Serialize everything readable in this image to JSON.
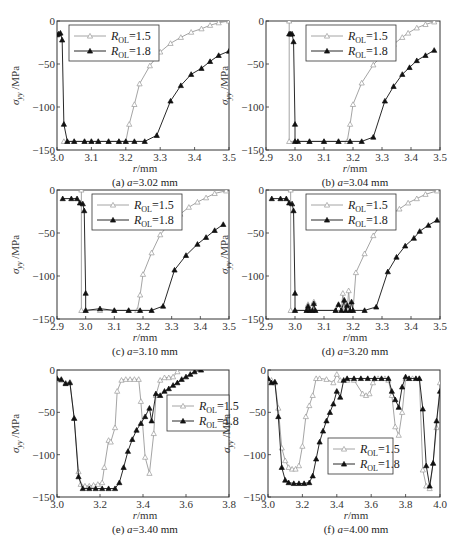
{
  "figure": {
    "y_label": "σyy /MPa",
    "x_label": "r/mm",
    "legend": [
      {
        "name": "ROL=1.5",
        "label_main": "R",
        "label_sub": "OL",
        "label_val": "=1.5",
        "marker": "open-triangle",
        "color": "#9a9a9a"
      },
      {
        "name": "ROL=1.8",
        "label_main": "R",
        "label_sub": "OL",
        "label_val": "=1.8",
        "marker": "filled-triangle",
        "color": "#111111"
      }
    ]
  },
  "chart_data": [
    {
      "id": "a",
      "type": "line",
      "caption_prefix": "(a) ",
      "caption_var": "a",
      "caption_value": "=3.02 mm",
      "xlabel": "r/mm",
      "ylabel": "σyy /MPa",
      "xlim": [
        3.0,
        3.5
      ],
      "ylim": [
        -150,
        0
      ],
      "xticks": [
        "3.0",
        "3.1",
        "3.2",
        "3.3",
        "3.4",
        "3.5"
      ],
      "yticks": [
        "0",
        "-50",
        "-100",
        "-150"
      ],
      "legend_position": "upper-left",
      "box": [
        57,
        21,
        229,
        150
      ],
      "series": [
        {
          "name": "ROL=1.5",
          "x": [
            3.02,
            3.03,
            3.05,
            3.08,
            3.1,
            3.12,
            3.15,
            3.18,
            3.2,
            3.21,
            3.225,
            3.24,
            3.27,
            3.3,
            3.33,
            3.36,
            3.39,
            3.42,
            3.445,
            3.47,
            3.5
          ],
          "y": [
            -140,
            -140,
            -140,
            -140,
            -140,
            -140,
            -140,
            -140,
            -140,
            -120,
            -97,
            -73,
            -52,
            -36,
            -26,
            -19,
            -13,
            -9,
            -5,
            -2,
            0
          ]
        },
        {
          "name": "ROL=1.8",
          "x": [
            3.0,
            3.005,
            3.01,
            3.015,
            3.02,
            3.03,
            3.05,
            3.08,
            3.1,
            3.12,
            3.15,
            3.18,
            3.2,
            3.225,
            3.255,
            3.29,
            3.33,
            3.36,
            3.39,
            3.42,
            3.445,
            3.47,
            3.5
          ],
          "y": [
            -16,
            -15,
            -14,
            -22,
            -120,
            -140,
            -140,
            -140,
            -140,
            -140,
            -140,
            -140,
            -140,
            -140,
            -140,
            -133,
            -93,
            -75,
            -62,
            -55,
            -47,
            -40,
            -35
          ]
        }
      ]
    },
    {
      "id": "b",
      "type": "line",
      "caption_prefix": "(b) ",
      "caption_var": "a",
      "caption_value": "=3.04 mm",
      "xlabel": "r/mm",
      "ylabel": "σyy /MPa",
      "xlim": [
        2.9,
        3.5
      ],
      "ylim": [
        -150,
        0
      ],
      "xticks": [
        "2.9",
        "3.0",
        "3.1",
        "3.2",
        "3.3",
        "3.4",
        "3.5"
      ],
      "yticks": [
        "0",
        "-50",
        "-100",
        "-150"
      ],
      "legend_position": "upper-center",
      "box": [
        266,
        21,
        440,
        150
      ],
      "series": [
        {
          "name": "ROL=1.5",
          "x": [
            2.98,
            2.98,
            3.0,
            3.05,
            3.1,
            3.15,
            3.18,
            3.19,
            3.2,
            3.23,
            3.27,
            3.31,
            3.34,
            3.37,
            3.39,
            3.42,
            3.45,
            3.48
          ],
          "y": [
            0,
            -140,
            -140,
            -140,
            -140,
            -140,
            -140,
            -120,
            -97,
            -72,
            -51,
            -36,
            -27,
            -19,
            -14,
            -8,
            -4,
            -1
          ]
        },
        {
          "name": "ROL=1.8",
          "x": [
            2.98,
            2.985,
            2.99,
            2.995,
            3.0,
            3.0,
            3.01,
            3.05,
            3.1,
            3.15,
            3.19,
            3.23,
            3.27,
            3.31,
            3.34,
            3.37,
            3.395,
            3.42,
            3.45,
            3.48
          ],
          "y": [
            -15,
            -15,
            -15,
            -24,
            -120,
            -140,
            -140,
            -140,
            -140,
            -140,
            -140,
            -140,
            -135,
            -93,
            -76,
            -62,
            -54,
            -46,
            -40,
            -34
          ]
        }
      ]
    },
    {
      "id": "c",
      "type": "line",
      "caption_prefix": "(c) ",
      "caption_var": "a",
      "caption_value": "=3.10 mm",
      "xlabel": "r/mm",
      "ylabel": "σyy /MPa",
      "xlim": [
        2.9,
        3.5
      ],
      "ylim": [
        -150,
        0
      ],
      "xticks": [
        "2.9",
        "3.0",
        "3.1",
        "3.2",
        "3.3",
        "3.4",
        "3.5"
      ],
      "yticks": [
        "0",
        "-50",
        "-100",
        "-150"
      ],
      "legend_position": "upper-center",
      "box": [
        57,
        190,
        229,
        319
      ],
      "series": [
        {
          "name": "ROL=1.5",
          "x": [
            2.985,
            2.985,
            3.0,
            3.05,
            3.1,
            3.15,
            3.18,
            3.19,
            3.2,
            3.23,
            3.26,
            3.3,
            3.33,
            3.36,
            3.39,
            3.42,
            3.45,
            3.49
          ],
          "y": [
            0,
            -140,
            -140,
            -140,
            -140,
            -140,
            -140,
            -122,
            -98,
            -73,
            -52,
            -36,
            -28,
            -20,
            -14,
            -9,
            -4,
            -1
          ]
        },
        {
          "name": "ROL=1.8",
          "x": [
            2.92,
            2.95,
            2.97,
            2.98,
            2.99,
            2.995,
            3.0,
            3.0,
            3.05,
            3.1,
            3.15,
            3.19,
            3.23,
            3.27,
            3.31,
            3.35,
            3.39,
            3.42,
            3.45,
            3.48
          ],
          "y": [
            -10,
            -10,
            -10,
            -15,
            -16,
            -24,
            -120,
            -140,
            -138,
            -140,
            -140,
            -140,
            -140,
            -135,
            -93,
            -76,
            -63,
            -55,
            -47,
            -40
          ]
        }
      ]
    },
    {
      "id": "d",
      "type": "line",
      "caption_prefix": "(d) ",
      "caption_var": "a",
      "caption_value": "=3.20 mm",
      "xlabel": "r/mm",
      "ylabel": "σyy /MPa",
      "xlim": [
        2.9,
        3.5
      ],
      "ylim": [
        -150,
        0
      ],
      "xticks": [
        "2.9",
        "3.0",
        "3.1",
        "3.2",
        "3.3",
        "3.4",
        "3.5"
      ],
      "yticks": [
        "0",
        "-50",
        "-100",
        "-150"
      ],
      "legend_position": "upper-center",
      "box": [
        266,
        190,
        440,
        319
      ],
      "series": [
        {
          "name": "ROL=1.5",
          "x": [
            2.985,
            2.985,
            3.0,
            3.04,
            3.045,
            3.05,
            3.06,
            3.065,
            3.07,
            3.14,
            3.16,
            3.165,
            3.17,
            3.18,
            3.185,
            3.19,
            3.2,
            3.21,
            3.24,
            3.27,
            3.3,
            3.33,
            3.36,
            3.39,
            3.42,
            3.45,
            3.49
          ],
          "y": [
            0,
            -140,
            -140,
            -140,
            -133,
            -140,
            -140,
            -130,
            -140,
            -140,
            -140,
            -120,
            -140,
            -140,
            -117,
            -140,
            -140,
            -96,
            -74,
            -53,
            -38,
            -29,
            -22,
            -15,
            -10,
            -5,
            -1
          ]
        },
        {
          "name": "ROL=1.8",
          "x": [
            2.92,
            2.95,
            2.97,
            2.98,
            2.99,
            2.995,
            3.0,
            3.0,
            3.04,
            3.045,
            3.05,
            3.06,
            3.065,
            3.07,
            3.14,
            3.15,
            3.16,
            3.17,
            3.175,
            3.18,
            3.19,
            3.195,
            3.2,
            3.24,
            3.28,
            3.32,
            3.35,
            3.38,
            3.41,
            3.43,
            3.46,
            3.49
          ],
          "y": [
            -10,
            -10,
            -10,
            -15,
            -16,
            -24,
            -120,
            -140,
            -140,
            -135,
            -140,
            -140,
            -132,
            -140,
            -140,
            -133,
            -140,
            -128,
            -140,
            -134,
            -140,
            -130,
            -140,
            -140,
            -136,
            -95,
            -78,
            -65,
            -56,
            -48,
            -41,
            -35
          ]
        }
      ]
    },
    {
      "id": "e",
      "type": "line",
      "caption_prefix": "(e) ",
      "caption_var": "a",
      "caption_value": "=3.40 mm",
      "xlabel": "r/mm",
      "ylabel": "σyy /MPa",
      "xlim": [
        3.0,
        3.8
      ],
      "ylim": [
        -150,
        0
      ],
      "xticks": [
        "3.0",
        "3.2",
        "3.4",
        "3.6",
        "3.8"
      ],
      "yticks": [
        "0",
        "-50",
        "-100",
        "-150"
      ],
      "legend_position": "right-center",
      "box": [
        57,
        370,
        229,
        497
      ],
      "series": [
        {
          "name": "ROL=1.5",
          "x": [
            3.0,
            3.02,
            3.04,
            3.06,
            3.08,
            3.1,
            3.11,
            3.13,
            3.15,
            3.17,
            3.19,
            3.21,
            3.22,
            3.24,
            3.25,
            3.27,
            3.28,
            3.3,
            3.32,
            3.34,
            3.36,
            3.38,
            3.39,
            3.41,
            3.43,
            3.45,
            3.46,
            3.48,
            3.5,
            3.52,
            3.54,
            3.56
          ],
          "y": [
            -10,
            -12,
            -15,
            -14,
            -57,
            -120,
            -135,
            -137,
            -137,
            -136,
            -135,
            -133,
            -115,
            -83,
            -85,
            -68,
            -25,
            -12,
            -11,
            -11,
            -11,
            -11,
            -37,
            -103,
            -122,
            -75,
            -30,
            -12,
            -9,
            -9,
            -8,
            -2
          ]
        },
        {
          "name": "ROL=1.8",
          "x": [
            3.0,
            3.02,
            3.04,
            3.06,
            3.08,
            3.1,
            3.12,
            3.15,
            3.18,
            3.21,
            3.24,
            3.27,
            3.29,
            3.31,
            3.33,
            3.35,
            3.37,
            3.39,
            3.41,
            3.43,
            3.44,
            3.46,
            3.48,
            3.5,
            3.52,
            3.54,
            3.56,
            3.58,
            3.6,
            3.62,
            3.64,
            3.67
          ],
          "y": [
            -10,
            -11,
            -16,
            -15,
            -57,
            -126,
            -140,
            -140,
            -140,
            -140,
            -140,
            -140,
            -133,
            -115,
            -96,
            -82,
            -71,
            -63,
            -55,
            -45,
            -60,
            -28,
            -30,
            -25,
            -22,
            -18,
            -15,
            -11,
            -8,
            -5,
            -2,
            0
          ]
        }
      ]
    },
    {
      "id": "f",
      "type": "line",
      "caption_prefix": "(f) ",
      "caption_var": "a",
      "caption_value": "=4.00 mm",
      "xlabel": "r/mm",
      "ylabel": "σyy /MPa",
      "xlim": [
        3.0,
        4.0
      ],
      "ylim": [
        -150,
        0
      ],
      "xticks": [
        "3.0",
        "3.2",
        "3.4",
        "3.6",
        "3.8",
        "4.0"
      ],
      "yticks": [
        "0",
        "-50",
        "-100",
        "-150"
      ],
      "legend_position": "center",
      "box": [
        268,
        370,
        440,
        497
      ],
      "series": [
        {
          "name": "ROL=1.5",
          "x": [
            3.0,
            3.02,
            3.04,
            3.06,
            3.08,
            3.1,
            3.12,
            3.14,
            3.16,
            3.18,
            3.2,
            3.22,
            3.24,
            3.26,
            3.28,
            3.3,
            3.34,
            3.38,
            3.4,
            3.42,
            3.46,
            3.5,
            3.55,
            3.57,
            3.59,
            3.61,
            3.64,
            3.68,
            3.7,
            3.72,
            3.74,
            3.76,
            3.78,
            3.8,
            3.84,
            3.88,
            3.9,
            3.92,
            3.94,
            3.96,
            3.98,
            4.0
          ],
          "y": [
            -10,
            -12,
            -15,
            -45,
            -92,
            -107,
            -115,
            -117,
            -117,
            -113,
            -90,
            -55,
            -42,
            -30,
            -10,
            -10,
            -11,
            -15,
            -5,
            -12,
            -12,
            -12,
            -28,
            -30,
            -28,
            -15,
            -10,
            -10,
            -12,
            -30,
            -67,
            -77,
            -50,
            -10,
            -10,
            -10,
            -118,
            -137,
            -140,
            -110,
            -68,
            -15
          ]
        },
        {
          "name": "ROL=1.8",
          "x": [
            3.0,
            3.02,
            3.04,
            3.06,
            3.08,
            3.1,
            3.12,
            3.15,
            3.18,
            3.21,
            3.24,
            3.26,
            3.28,
            3.3,
            3.32,
            3.34,
            3.36,
            3.38,
            3.4,
            3.42,
            3.44,
            3.46,
            3.5,
            3.54,
            3.58,
            3.62,
            3.66,
            3.7,
            3.72,
            3.74,
            3.76,
            3.78,
            3.8,
            3.82,
            3.86,
            3.88,
            3.9,
            3.92,
            3.94,
            3.96,
            3.98,
            4.0
          ],
          "y": [
            -10,
            -15,
            -14,
            -55,
            -115,
            -130,
            -133,
            -134,
            -134,
            -134,
            -133,
            -125,
            -105,
            -85,
            -72,
            -60,
            -50,
            -40,
            -25,
            -32,
            -12,
            -10,
            -10,
            -10,
            -10,
            -10,
            -10,
            -10,
            -25,
            -35,
            -44,
            -20,
            -8,
            -10,
            -10,
            -10,
            -46,
            -113,
            -137,
            -110,
            -60,
            -25
          ]
        }
      ]
    }
  ]
}
